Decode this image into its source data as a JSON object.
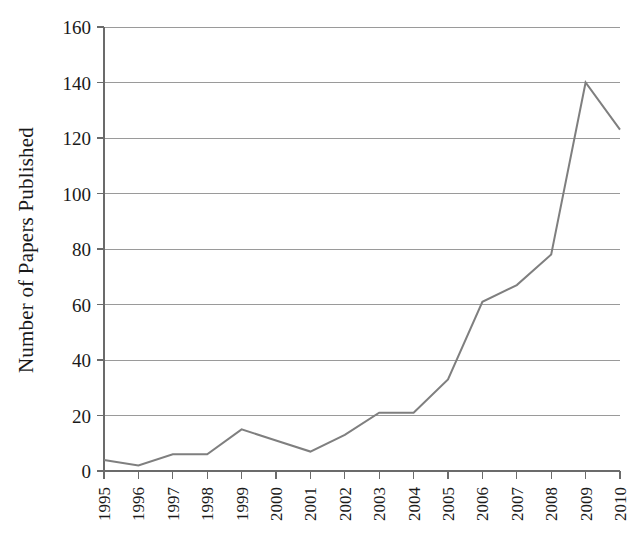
{
  "chart_data": {
    "type": "line",
    "title": "",
    "xlabel": "",
    "ylabel": "Number of Papers Published",
    "categories": [
      "1995",
      "1996",
      "1997",
      "1998",
      "1999",
      "2000",
      "2001",
      "2002",
      "2003",
      "2004",
      "2005",
      "2006",
      "2007",
      "2008",
      "2009",
      "2010"
    ],
    "values": [
      4,
      2,
      6,
      6,
      15,
      11,
      7,
      13,
      21,
      21,
      33,
      61,
      67,
      78,
      140,
      123
    ],
    "series": [
      {
        "name": "Papers Published",
        "values": [
          4,
          2,
          6,
          6,
          15,
          11,
          7,
          13,
          21,
          21,
          33,
          61,
          67,
          78,
          140,
          123
        ],
        "color": "#7f7f7f"
      }
    ],
    "ylim": [
      0,
      160
    ],
    "yticks": [
      0,
      20,
      40,
      60,
      80,
      100,
      120,
      140,
      160
    ],
    "ytick_labels": [
      "0",
      "20",
      "40",
      "60",
      "80",
      "100",
      "120",
      "140",
      "160"
    ],
    "xtick_labels": [
      "1995",
      "1996",
      "1997",
      "1998",
      "1999",
      "2000",
      "2001",
      "2002",
      "2003",
      "2004",
      "2005",
      "2006",
      "2007",
      "2008",
      "2009",
      "2010"
    ],
    "grid": true,
    "grid_axis": "y",
    "legend": false,
    "legend_position": "none",
    "x_label_rotation": -90,
    "colors": {
      "line": "#7f7f7f",
      "grid": "#9a9a9a",
      "axis": "#6b6b6b",
      "text": "#1a1a1a",
      "background": "#ffffff"
    }
  }
}
